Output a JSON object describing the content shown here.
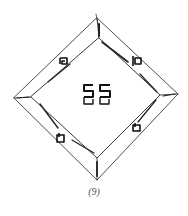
{
  "figure": {
    "monogram": "SS",
    "caption": "(9)",
    "stroke_color": "#222222"
  }
}
